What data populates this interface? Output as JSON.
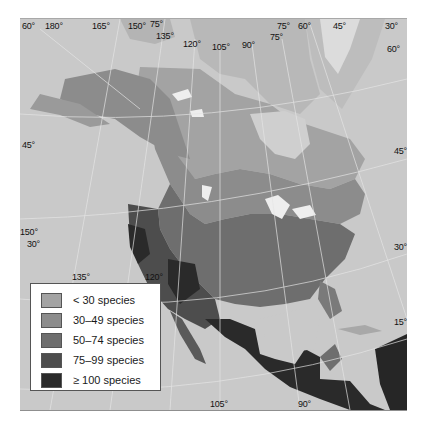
{
  "map": {
    "subject": "Species richness by region, North America",
    "colors": {
      "ocean": "#c9c9c9",
      "land_non_region": "#b9b9b9",
      "ice": "#d8d8d8",
      "lakes": "#eeeeee",
      "graticule": "#e6e6e6"
    },
    "graticule_labels": {
      "top": [
        {
          "text": "60°",
          "x": 22,
          "y": 22
        },
        {
          "text": "180°",
          "x": 45,
          "y": 22
        },
        {
          "text": "165°",
          "x": 92,
          "y": 22
        },
        {
          "text": "150°",
          "x": 128,
          "y": 22
        },
        {
          "text": "75°",
          "x": 150,
          "y": 20
        },
        {
          "text": "135°",
          "x": 156,
          "y": 32
        },
        {
          "text": "120°",
          "x": 183,
          "y": 40
        },
        {
          "text": "105°",
          "x": 212,
          "y": 42
        },
        {
          "text": "90°",
          "x": 242,
          "y": 40
        },
        {
          "text": "75°",
          "x": 270,
          "y": 32
        },
        {
          "text": "75°",
          "x": 277,
          "y": 22
        },
        {
          "text": "60°",
          "x": 298,
          "y": 22
        },
        {
          "text": "45°",
          "x": 333,
          "y": 22
        },
        {
          "text": "30°",
          "x": 385,
          "y": 22
        },
        {
          "text": "60°",
          "x": 387,
          "y": 44
        }
      ],
      "left": [
        {
          "text": "45°",
          "x": 22,
          "y": 141
        },
        {
          "text": "150°",
          "x": 20,
          "y": 228
        },
        {
          "text": "30°",
          "x": 27,
          "y": 240
        }
      ],
      "right": [
        {
          "text": "45°",
          "x": 394,
          "y": 147
        },
        {
          "text": "30°",
          "x": 394,
          "y": 243
        },
        {
          "text": "15°",
          "x": 394,
          "y": 318
        }
      ],
      "bottom": [
        {
          "text": "135°",
          "x": 72,
          "y": 273
        },
        {
          "text": "120°",
          "x": 145,
          "y": 273
        },
        {
          "text": "105°",
          "x": 210,
          "y": 400
        },
        {
          "text": "90°",
          "x": 298,
          "y": 400
        }
      ]
    }
  },
  "legend": {
    "items": [
      {
        "label": "< 30 species",
        "color": "#a3a3a3"
      },
      {
        "label": "30–49 species",
        "color": "#8c8c8c"
      },
      {
        "label": "50–74 species",
        "color": "#6e6e6e"
      },
      {
        "label": "75–99 species",
        "color": "#4d4d4d"
      },
      {
        "label": "≥ 100 species",
        "color": "#2a2a2a"
      }
    ]
  }
}
